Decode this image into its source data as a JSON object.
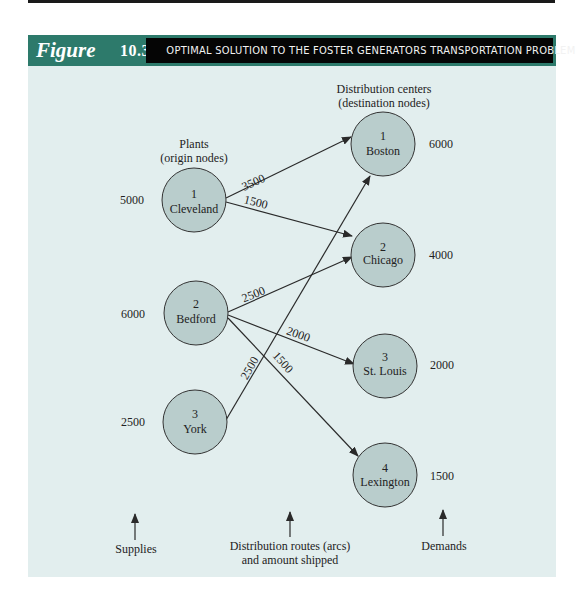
{
  "figure": {
    "label": "Figure",
    "number": "10.3",
    "title": "OPTIMAL SOLUTION TO THE FOSTER GENERATORS TRANSPORTATION PROBLEM"
  },
  "colors": {
    "header_teal": "#2d7a6b",
    "title_bar": "#050505",
    "panel_bg": "#e2eeee",
    "node_fill": "#b9cdcc",
    "line": "#2a2a2a"
  },
  "headings": {
    "origins_line1": "Plants",
    "origins_line2": "(origin nodes)",
    "destinations_line1": "Distribution centers",
    "destinations_line2": "(destination nodes)"
  },
  "origins": [
    {
      "id": "1",
      "name": "Cleveland",
      "supply": "5000"
    },
    {
      "id": "2",
      "name": "Bedford",
      "supply": "6000"
    },
    {
      "id": "3",
      "name": "York",
      "supply": "2500"
    }
  ],
  "destinations": [
    {
      "id": "1",
      "name": "Boston",
      "demand": "6000"
    },
    {
      "id": "2",
      "name": "Chicago",
      "demand": "4000"
    },
    {
      "id": "3",
      "name": "St. Louis",
      "demand": "2000"
    },
    {
      "id": "4",
      "name": "Lexington",
      "demand": "1500"
    }
  ],
  "arcs": [
    {
      "from": "Cleveland",
      "to": "Boston",
      "amount": "3500"
    },
    {
      "from": "Cleveland",
      "to": "Chicago",
      "amount": "1500"
    },
    {
      "from": "Bedford",
      "to": "Chicago",
      "amount": "2500"
    },
    {
      "from": "Bedford",
      "to": "St. Louis",
      "amount": "2000"
    },
    {
      "from": "Bedford",
      "to": "Lexington",
      "amount": "1500"
    },
    {
      "from": "York",
      "to": "Boston",
      "amount": "2500"
    }
  ],
  "footer": {
    "supplies": "Supplies",
    "routes_line1": "Distribution routes (arcs)",
    "routes_line2": "and amount shipped",
    "demands": "Demands"
  }
}
